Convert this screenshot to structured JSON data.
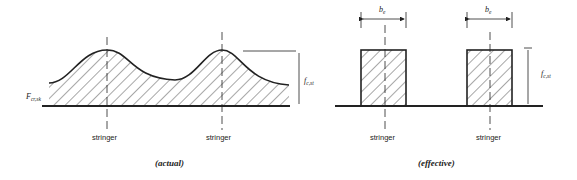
{
  "diagrams": [
    {
      "caption": "(actual)",
      "stringer_labels": [
        "stringer",
        "stringer"
      ],
      "skin_stress_label": {
        "main": "F",
        "sub": "cr,sk"
      },
      "height_label": {
        "main": "f",
        "sub": "c,st"
      }
    },
    {
      "caption": "(effective)",
      "stringer_labels": [
        "stringer",
        "stringer"
      ],
      "width_labels": [
        {
          "main": "b",
          "sub": "e"
        },
        {
          "main": "b",
          "sub": "e"
        }
      ],
      "height_label": {
        "main": "f",
        "sub": "c,st"
      }
    }
  ]
}
